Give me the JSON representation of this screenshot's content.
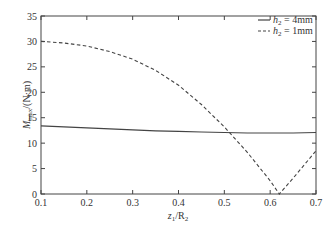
{
  "chart_data": {
    "type": "line",
    "title": "",
    "xlabel": "z1/R2",
    "ylabel": "Mmax/(N·m)",
    "xlim": [
      0.1,
      0.7
    ],
    "ylim": [
      0,
      35
    ],
    "xticks": [
      0.1,
      0.2,
      0.3,
      0.4,
      0.5,
      0.6,
      0.7
    ],
    "yticks": [
      0,
      5,
      10,
      15,
      20,
      25,
      30,
      35
    ],
    "grid": false,
    "legend_position": "upper right",
    "series": [
      {
        "name": "h2 = 4mm",
        "style": "solid",
        "x": [
          0.1,
          0.15,
          0.2,
          0.25,
          0.3,
          0.35,
          0.4,
          0.45,
          0.5,
          0.55,
          0.6,
          0.65,
          0.7
        ],
        "y": [
          13.4,
          13.2,
          13.0,
          12.8,
          12.6,
          12.4,
          12.3,
          12.2,
          12.1,
          12.0,
          12.0,
          12.0,
          12.1
        ]
      },
      {
        "name": "h2 = 1mm",
        "style": "dashed",
        "x": [
          0.1,
          0.15,
          0.2,
          0.25,
          0.3,
          0.35,
          0.4,
          0.45,
          0.5,
          0.55,
          0.6,
          0.62,
          0.65,
          0.7
        ],
        "y": [
          30.0,
          29.7,
          29.1,
          28.0,
          26.5,
          24.3,
          21.4,
          17.6,
          13.2,
          8.2,
          2.6,
          0.0,
          3.1,
          8.5
        ]
      }
    ]
  },
  "labels": {
    "ylabel_main": "M",
    "ylabel_sub": "max",
    "ylabel_unit": "/(N·m)",
    "xlabel_main": "z",
    "xlabel_sub1": "1",
    "xlabel_mid": "/R",
    "xlabel_sub2": "2",
    "legend": [
      {
        "prefix": "h",
        "sub": "2",
        "suffix": " = 4mm"
      },
      {
        "prefix": "h",
        "sub": "2",
        "suffix": " = 1mm"
      }
    ]
  }
}
